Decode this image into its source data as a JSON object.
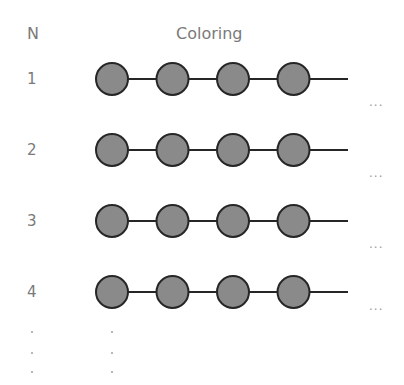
{
  "header": {
    "n_label": "N",
    "coloring_label": "Coloring"
  },
  "rows": [
    {
      "n": "1",
      "y": 79,
      "nodes": 4,
      "ellipsis": "..."
    },
    {
      "n": "2",
      "y": 150,
      "nodes": 4,
      "ellipsis": "..."
    },
    {
      "n": "3",
      "y": 221,
      "nodes": 4,
      "ellipsis": "..."
    },
    {
      "n": "4",
      "y": 292,
      "nodes": 4,
      "ellipsis": "..."
    }
  ],
  "colors": {
    "node_fill": "#8a8a8a",
    "node_stroke": "#262626",
    "edge": "#262626",
    "text": "#7a7a7a"
  },
  "continuation": {
    "symbol": "⋮"
  }
}
